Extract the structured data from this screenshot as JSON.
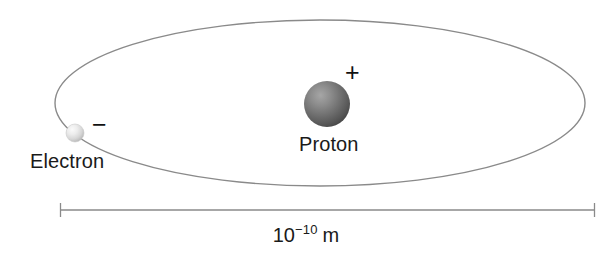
{
  "figure": {
    "background_color": "#ffffff"
  },
  "orbit": {
    "name": "electron-orbit-ellipse",
    "center_x": 320,
    "center_y": 103,
    "radius_x": 265,
    "radius_y": 83,
    "stroke_color": "#8a8a8a",
    "stroke_width": 1.4
  },
  "proton": {
    "label": "Proton",
    "charge_symbol": "+",
    "center_x": 327,
    "center_y": 104,
    "radius": 23,
    "fill_light": "#9e9e9e",
    "fill_mid": "#707070",
    "fill_dark": "#4b4b4b"
  },
  "electron": {
    "label": "Electron",
    "charge_symbol": "−",
    "center_x": 75,
    "center_y": 133,
    "radius": 9,
    "fill_light": "#f2f2f2",
    "fill_mid": "#d8d8d8",
    "fill_dark": "#b4b4b4"
  },
  "scale_bar": {
    "name": "size-scale-bar",
    "value_base": "10",
    "value_exponent": "−10",
    "unit": "m",
    "x_start": 60,
    "x_end": 595,
    "y": 210,
    "cap_height": 14,
    "stroke_color": "#8a8a8a",
    "stroke_width": 1.3
  }
}
